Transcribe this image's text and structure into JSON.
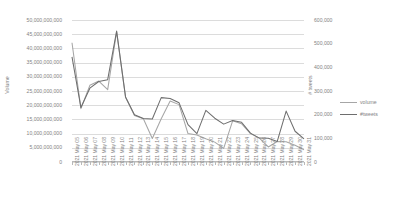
{
  "chart_data": {
    "type": "line",
    "title": "",
    "xlabel": "",
    "ylabel": "Volume",
    "y2label": "# tweets",
    "grid": true,
    "legend_position": "right",
    "ylim": [
      0,
      50000000000
    ],
    "y2lim": [
      0,
      600000
    ],
    "ytick_labels": [
      "50,000,000,000",
      "45,000,000,000",
      "40,000,000,000",
      "35,000,000,000",
      "30,000,000,000",
      "25,000,000,000",
      "20,000,000,000",
      "15,000,000,000",
      "10,000,000,000",
      "5,000,000,000",
      "0"
    ],
    "ytick_values": [
      50000000000,
      45000000000,
      40000000000,
      35000000000,
      30000000000,
      25000000000,
      20000000000,
      15000000000,
      10000000000,
      5000000000,
      0
    ],
    "y2tick_labels": [
      "600,000",
      "500,000",
      "400,000",
      "300,000",
      "200,000",
      "100,000",
      "0"
    ],
    "y2tick_values": [
      600000,
      500000,
      400000,
      300000,
      200000,
      100000,
      0
    ],
    "categories": [
      "2021 May 05",
      "2021 May 06",
      "2021 May 07",
      "2021 May 08",
      "2021 May 09",
      "2021 May 10",
      "2021 May 11",
      "2021 May 12",
      "2021 May 13",
      "2021 May 14",
      "2021 May 15",
      "2021 May 16",
      "2021 May 17",
      "2021 May 18",
      "2021 May 19",
      "2021 May 20",
      "2021 May 21",
      "2021 May 22",
      "2021 May 23",
      "2021 May 24",
      "2021 May 25",
      "2021 May 26",
      "2021 May 27",
      "2021 May 28",
      "2021 May 29",
      "2021 May 30",
      "2021 May 31"
    ],
    "series": [
      {
        "name": "volume",
        "axis": "left",
        "color": "#a6a6a6",
        "values": [
          42000000000,
          18800000000,
          27000000000,
          28500000000,
          25500000000,
          45800000000,
          22800000000,
          16400000000,
          15200000000,
          8300000000,
          15200000000,
          21500000000,
          20200000000,
          10000000000,
          9500000000,
          8200000000,
          7000000000,
          4800000000,
          14500000000,
          13500000000,
          10000000000,
          8400000000,
          5300000000,
          7200000000,
          7100000000,
          5900000000,
          4300000000
        ]
      },
      {
        "name": "#tweets",
        "axis": "right",
        "color": "#6e6e6e",
        "values": [
          444000,
          230000,
          312000,
          340000,
          348000,
          553000,
          275000,
          200000,
          184000,
          182000,
          272000,
          268000,
          250000,
          158000,
          120000,
          218000,
          185000,
          160000,
          175000,
          168000,
          122000,
          101000,
          100000,
          87000,
          215000,
          130000,
          98000
        ]
      }
    ],
    "series_extra_note": ""
  },
  "legend": {
    "entries": [
      {
        "label": "volume"
      },
      {
        "label": "#tweets"
      }
    ]
  },
  "colors": {
    "grid": "#dcdcdc",
    "axis": "#b9b9b9",
    "text": "#838383",
    "volume": "#a6a6a6",
    "tweets": "#6e6e6e"
  }
}
